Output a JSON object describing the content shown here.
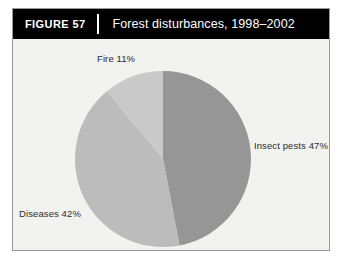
{
  "figure": {
    "number_label": "FIGURE 57",
    "title": "Forest disturbances, 1998–2002"
  },
  "colors": {
    "header_background": "#000000",
    "header_text": "#ffffff",
    "panel_background": "#f2f2f0",
    "panel_border": "#9a9a9a",
    "slice_insect_pests": "#969696",
    "slice_diseases": "#bcbcbc",
    "slice_fire": "#c9c9c9",
    "label_text": "#2b2b2b"
  },
  "labels": {
    "fire": "Fire 11%",
    "insect_pests": "Insect pests 47%",
    "diseases": "Diseases 42%"
  },
  "chart_data": {
    "type": "pie",
    "title": "Forest disturbances, 1998–2002",
    "categories": [
      "Insect pests",
      "Diseases",
      "Fire"
    ],
    "values": [
      47,
      42,
      11
    ],
    "unit": "%",
    "labels": [
      "Insect pests 47%",
      "Diseases 42%",
      "Fire 11%"
    ],
    "colors": [
      "#969696",
      "#bcbcbc",
      "#c9c9c9"
    ],
    "start_angle_deg": 0,
    "direction": "clockwise",
    "legend": "none",
    "grid": false,
    "annotations": [
      {
        "text": "Fire 11%",
        "position": "top-left-outside"
      },
      {
        "text": "Insect pests 47%",
        "position": "right-outside"
      },
      {
        "text": "Diseases 42%",
        "position": "bottom-left-outside"
      }
    ]
  }
}
